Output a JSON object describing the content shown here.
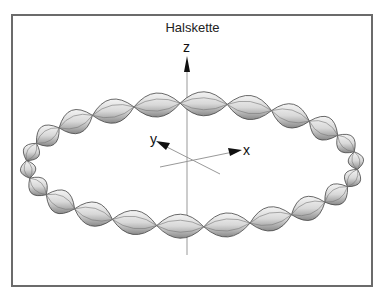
{
  "figure": {
    "title": "Halskette",
    "axes": {
      "x_label": "x",
      "y_label": "y",
      "z_label": "z"
    },
    "necklace": {
      "center": [
        192,
        165
      ],
      "radius_x": 166,
      "radius_y": 62,
      "bead_count": 22,
      "bead_color": "#d9d9d9",
      "outline_color": "#333333"
    },
    "colors": {
      "frame": "#6b6b6b",
      "axis": "#888888",
      "arrow": "#111111"
    }
  }
}
